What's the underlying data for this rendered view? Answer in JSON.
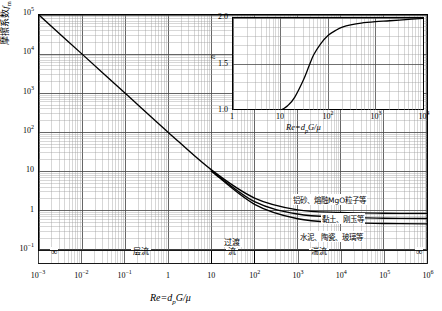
{
  "chart_data": [
    {
      "type": "line",
      "id": "main-friction-factor-chart",
      "title": "",
      "xlabel": "Re=d_pG/μ",
      "ylabel": "摩擦系数 f_m",
      "xscale": "log",
      "yscale": "log",
      "xlim": [
        0.001,
        1000000
      ],
      "ylim": [
        0.1,
        100000
      ],
      "grid": true,
      "xticklabels": [
        "10⁻³",
        "10⁻²",
        "10⁻¹",
        "1",
        "10",
        "10²",
        "10³",
        "10⁴",
        "10⁵",
        "10⁶"
      ],
      "yticklabels": [
        "10⁻¹",
        "1",
        "10",
        "10²",
        "10³",
        "10⁴",
        "10⁵"
      ],
      "series": [
        {
          "name": "铝砂、熔融MgO粒子等",
          "x": [
            0.001,
            0.01,
            0.1,
            1,
            10,
            100,
            1000,
            10000,
            100000,
            1000000
          ],
          "y": [
            100000,
            10000,
            1000,
            100,
            11,
            2.1,
            1.05,
            0.9,
            0.86,
            0.85
          ]
        },
        {
          "name": "黏土、刚玉等",
          "x": [
            10,
            100,
            1000,
            10000,
            100000,
            1000000
          ],
          "y": [
            10.5,
            1.7,
            0.82,
            0.68,
            0.64,
            0.63
          ]
        },
        {
          "name": "水泥、陶瓷、玻璃等",
          "x": [
            10,
            100,
            1000,
            10000,
            100000,
            1000000
          ],
          "y": [
            10.2,
            1.45,
            0.62,
            0.5,
            0.47,
            0.46
          ]
        }
      ],
      "regimes": [
        {
          "label": "层流",
          "from": 0.001,
          "to": 10
        },
        {
          "label": "过渡流",
          "from": 10,
          "to": 100
        },
        {
          "label": "湍流",
          "from": 100,
          "to": 1000000
        }
      ],
      "regime_end_markers": [
        "∞",
        "∞"
      ]
    },
    {
      "type": "line",
      "id": "inset-exponent-chart",
      "title": "",
      "xlabel": "Re=d_pG/μ",
      "ylabel": "n",
      "xscale": "log",
      "yscale": "linear",
      "xlim": [
        1,
        10000
      ],
      "ylim": [
        1.0,
        2.0
      ],
      "grid": true,
      "xticklabels": [
        "1",
        "10",
        "10²",
        "10³",
        "10⁴"
      ],
      "yticklabels": [
        "1.0",
        "1.5",
        "2.0"
      ],
      "series": [
        {
          "name": "n",
          "x": [
            1,
            5,
            10,
            15,
            20,
            30,
            40,
            50,
            70,
            100,
            150,
            200,
            300,
            500,
            1000,
            2000,
            5000,
            10000
          ],
          "y": [
            1.0,
            1.0,
            1.0,
            1.06,
            1.14,
            1.32,
            1.48,
            1.6,
            1.72,
            1.81,
            1.87,
            1.9,
            1.925,
            1.945,
            1.96,
            1.97,
            1.985,
            1.995
          ]
        }
      ]
    }
  ],
  "main": {
    "y_axis_label_cn": "摩擦系数",
    "y_axis_label_sym": "f",
    "y_axis_label_sub": "m",
    "x_axis_label": "Re=d",
    "x_axis_label_sub": "p",
    "x_axis_label_tail": "G/μ",
    "y_ticks": [
      {
        "mantissa": "10",
        "exp": "5"
      },
      {
        "mantissa": "10",
        "exp": "4"
      },
      {
        "mantissa": "10",
        "exp": "3"
      },
      {
        "mantissa": "10",
        "exp": "2"
      },
      {
        "mantissa": "10",
        "exp": ""
      },
      {
        "mantissa": "1",
        "exp": ""
      },
      {
        "mantissa": "10",
        "exp": "-1"
      }
    ],
    "x_ticks": [
      {
        "mantissa": "10",
        "exp": "-3"
      },
      {
        "mantissa": "10",
        "exp": "-2"
      },
      {
        "mantissa": "10",
        "exp": "-1"
      },
      {
        "mantissa": "1",
        "exp": ""
      },
      {
        "mantissa": "10",
        "exp": ""
      },
      {
        "mantissa": "10",
        "exp": "2"
      },
      {
        "mantissa": "10",
        "exp": "3"
      },
      {
        "mantissa": "10",
        "exp": "4"
      },
      {
        "mantissa": "10",
        "exp": "5"
      },
      {
        "mantissa": "10",
        "exp": "6"
      }
    ],
    "regime_laminar": "层流",
    "regime_transition_1": "过渡",
    "regime_transition_2": "流",
    "regime_turbulent": "湍流",
    "infinity_left": "∞",
    "infinity_right": "∞",
    "annotation_1": "铝砂、熔融MgO粒子等",
    "annotation_2": "黏土、刚玉等",
    "annotation_3": "水泥、陶瓷、玻璃等"
  },
  "inset": {
    "y_axis_label": "n",
    "x_axis_label": "Re=d",
    "x_axis_label_sub": "p",
    "x_axis_label_tail": "G/μ",
    "y_ticks": [
      "2.0",
      "1.5",
      "1.0"
    ],
    "x_ticks": [
      {
        "mantissa": "1",
        "exp": ""
      },
      {
        "mantissa": "10",
        "exp": ""
      },
      {
        "mantissa": "10",
        "exp": "2"
      },
      {
        "mantissa": "10",
        "exp": "3"
      },
      {
        "mantissa": "10",
        "exp": "4"
      }
    ]
  },
  "colors": {
    "line": "#000000",
    "grid_major": "#4a4a4a",
    "grid_minor": "#9a9a9a",
    "background": "#ffffff"
  }
}
